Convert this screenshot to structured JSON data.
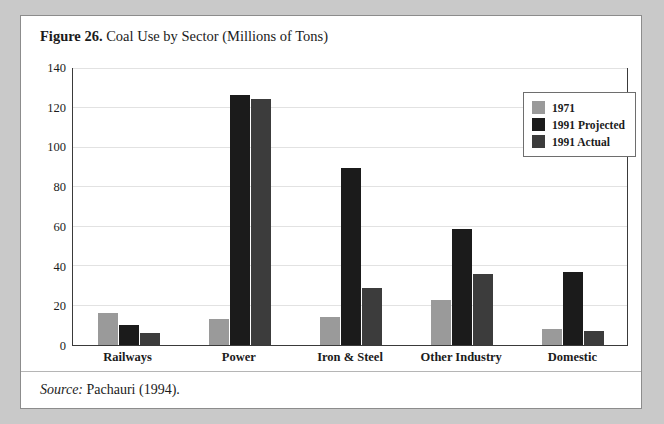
{
  "figure": {
    "number_label": "Figure 26.",
    "caption": "Coal Use by Sector (Millions of Tons)",
    "source_word": "Source:",
    "source_text": "Pachauri (1994)."
  },
  "colors": {
    "series_1971": "#9a9a9a",
    "series_1991_projected": "#1b1b1b",
    "series_1991_actual": "#3c3c3c",
    "frame": "#3a3a3a",
    "gridline": "#e2e2e2",
    "page_background": "#ffffff",
    "outer_background": "#c9c9c9"
  },
  "chart_data": {
    "type": "bar",
    "title": "Coal Use by Sector (Millions of Tons)",
    "xlabel": "",
    "ylabel": "",
    "ylim": [
      0,
      140
    ],
    "yticks": [
      0,
      20,
      40,
      60,
      80,
      100,
      120,
      140
    ],
    "grid": true,
    "legend_position": "top-right",
    "categories": [
      "Railways",
      "Power",
      "Iron & Steel",
      "Other Industry",
      "Domestic"
    ],
    "series": [
      {
        "name": "1971",
        "values": [
          16,
          13,
          14,
          23,
          8
        ]
      },
      {
        "name": "1991 Projected",
        "values": [
          10,
          127,
          90,
          59,
          37
        ]
      },
      {
        "name": "1991 Actual",
        "values": [
          6,
          125,
          29,
          36,
          7
        ]
      }
    ]
  }
}
